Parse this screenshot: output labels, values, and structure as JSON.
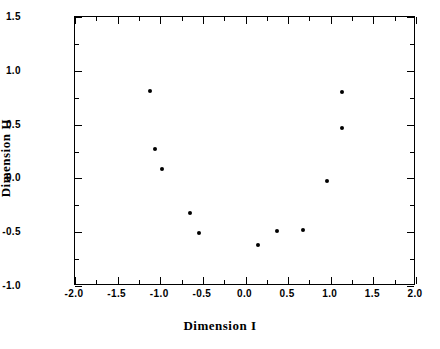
{
  "chart_data": {
    "type": "scatter",
    "title": "",
    "xlabel": "Dimension  I",
    "ylabel": "Dimension  II",
    "xlim": [
      -2.0,
      2.0
    ],
    "ylim": [
      -1.0,
      1.5
    ],
    "grid": false,
    "legend": null,
    "x_major_ticks": [
      -2.0,
      -1.5,
      -1.0,
      -0.5,
      0.0,
      0.5,
      1.0,
      1.5,
      2.0
    ],
    "x_tick_labels": [
      "-2.0",
      "-1.5",
      "-1.0",
      "-0.5",
      "0.0",
      "0.5",
      "1.0",
      "1.5",
      "2.0"
    ],
    "x_minor_ticks": [
      -1.75,
      -1.25,
      -0.75,
      -0.25,
      0.25,
      0.75,
      1.25,
      1.75
    ],
    "y_major_ticks": [
      -1.0,
      -0.5,
      0.0,
      0.5,
      1.0,
      1.5
    ],
    "y_tick_labels": [
      "-1.0",
      "-0.5",
      "0.0",
      "0.5",
      "1.0",
      "1.5"
    ],
    "y_minor_ticks": [
      -0.75,
      -0.25,
      0.25,
      0.75,
      1.25
    ],
    "marker": "filled-circle",
    "marker_color": "#000000",
    "points": [
      {
        "x": -1.12,
        "y": 0.81
      },
      {
        "x": -1.06,
        "y": 0.27
      },
      {
        "x": -0.98,
        "y": 0.09
      },
      {
        "x": -0.65,
        "y": -0.32
      },
      {
        "x": -0.55,
        "y": -0.51
      },
      {
        "x": 0.15,
        "y": -0.62
      },
      {
        "x": 0.37,
        "y": -0.49
      },
      {
        "x": 0.68,
        "y": -0.48
      },
      {
        "x": 0.96,
        "y": -0.02
      },
      {
        "x": 1.13,
        "y": 0.8
      },
      {
        "x": 1.13,
        "y": 0.47
      }
    ]
  },
  "colors": {
    "axis": "#000000",
    "background": "#ffffff",
    "marker": "#000000"
  }
}
